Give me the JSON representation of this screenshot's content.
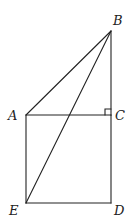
{
  "diagram": {
    "type": "geometry",
    "colors": {
      "stroke": "#222222",
      "background": "#ffffff"
    },
    "points": {
      "A": {
        "label": "A",
        "x": 26,
        "y": 115
      },
      "B": {
        "label": "B",
        "x": 111,
        "y": 31
      },
      "C": {
        "label": "C",
        "x": 111,
        "y": 115
      },
      "D": {
        "label": "D",
        "x": 111,
        "y": 203
      },
      "E": {
        "label": "E",
        "x": 26,
        "y": 203
      }
    },
    "segments": [
      "AB",
      "BE",
      "BC",
      "AC",
      "CD",
      "DE",
      "EA"
    ],
    "right_angle_at": "C",
    "labels": {
      "A": "A",
      "B": "B",
      "C": "C",
      "D": "D",
      "E": "E"
    }
  }
}
